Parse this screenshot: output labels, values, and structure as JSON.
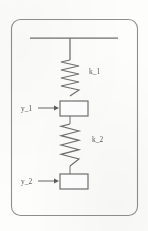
{
  "figure": {
    "kind": "mechanical-system-diagram",
    "frame": {
      "shape": "rounded-rectangle",
      "x": 11.5,
      "y": 19.5,
      "width": 126,
      "height": 196,
      "corner_radius": 9,
      "stroke_color": "#8e8e8e"
    },
    "support": {
      "name": "fixed-ceiling",
      "line_x1": 30,
      "line_x2": 118,
      "line_y": 38,
      "stem_x": 70,
      "stem_y1": 38,
      "stem_y2": 60,
      "stroke_color": "#6e6e6e"
    },
    "springs": [
      {
        "name": "spring-k1",
        "label": "k_1",
        "label_x": 89,
        "label_y": 74,
        "x_center": 70,
        "y_top": 60,
        "y_bottom": 96,
        "amplitude": 9,
        "coils": 4,
        "stroke_color": "#6f6f6f"
      },
      {
        "name": "spring-k2",
        "label": "k_2",
        "label_x": 92,
        "label_y": 142,
        "x_center": 70,
        "y_top": 124,
        "y_bottom": 166,
        "amplitude": 9,
        "coils": 4,
        "stroke_color": "#6f6f6f"
      }
    ],
    "masses": [
      {
        "name": "mass-1",
        "x": 60,
        "y": 101,
        "width": 28,
        "height": 15,
        "fill": "#ffffff",
        "stroke_color": "#6b6b6b"
      },
      {
        "name": "mass-2",
        "x": 60,
        "y": 174,
        "width": 28,
        "height": 15,
        "fill": "#ffffff",
        "stroke_color": "#6b6b6b"
      }
    ],
    "connectors": [
      {
        "name": "connector-mass1-to-spring2",
        "x": 70,
        "y1": 116,
        "y2": 124
      },
      {
        "name": "connector-spring2-to-mass2",
        "x": 70,
        "y1": 166,
        "y2": 174
      }
    ],
    "displacements": [
      {
        "name": "displacement-y1",
        "label": "y_1",
        "label_x": 21,
        "label_y": 111,
        "arrow_x1": 38,
        "arrow_x2": 59,
        "arrow_y": 108,
        "direction": "right",
        "stroke_color": "#7a7a7a"
      },
      {
        "name": "displacement-y2",
        "label": "y_2",
        "label_x": 21,
        "label_y": 184,
        "arrow_x1": 38,
        "arrow_x2": 59,
        "arrow_y": 181,
        "direction": "right",
        "stroke_color": "#7a7a7a"
      }
    ]
  }
}
